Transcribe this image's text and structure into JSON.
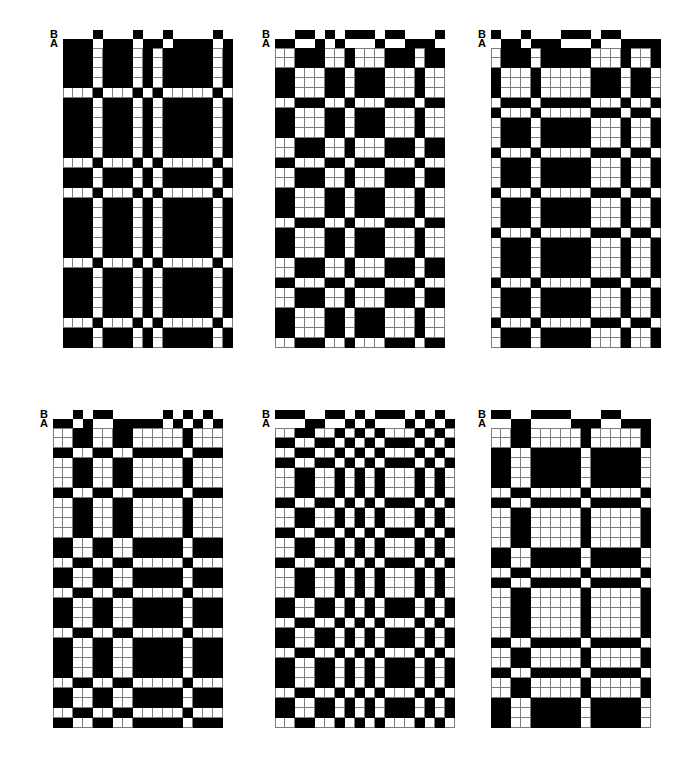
{
  "figure": {
    "kind": "weave-draft-figure",
    "background_color": "#ffffff",
    "ink_color": "#000000",
    "grid_line_color": "#7d7d7d",
    "cell_size_px": 10,
    "shaft_cell_height_px": 9,
    "legend": {
      "shaft_b_label": "B",
      "shaft_a_label": "A"
    }
  },
  "panels": [
    {
      "id": "panel-1",
      "position": "top-left",
      "x": 50,
      "y": 30,
      "columns": 17,
      "rows": 30,
      "shafts": {
        "b_label": "B",
        "a_label": "A",
        "b": [
          0,
          0,
          0,
          1,
          0,
          0,
          0,
          1,
          0,
          0,
          1,
          0,
          0,
          0,
          0,
          1,
          0
        ],
        "a": [
          1,
          1,
          1,
          0,
          1,
          1,
          1,
          0,
          1,
          1,
          0,
          1,
          1,
          1,
          1,
          0,
          1
        ]
      },
      "grid": [
        "11101110111011110111",
        "11101110111011110111",
        "00100011100110000100",
        "11101110111011110111",
        "11101110111011110111",
        "11101110111011110111",
        "11101110111011110111",
        "00100011100110000100",
        "11101110111011110111",
        "00100011100110000100",
        "11101110111011110111",
        "11101110111011110111",
        "11101110111011110111",
        "00100011100110000100",
        "11101110111011110111",
        "11101110111011110111",
        "11101110111011110111",
        "11101110111011110111",
        "00100011100110000100",
        "11101110111011110111",
        "11101110111011110111",
        "00100011100110000100",
        "11101110111011110111"
      ]
    },
    {
      "id": "panel-2",
      "position": "top-center",
      "x": 262,
      "y": 30,
      "columns": 17,
      "rows": 30,
      "shafts": {
        "b_label": "B",
        "a_label": "A",
        "b": [
          0,
          0,
          1,
          1,
          0,
          1,
          0,
          1,
          1,
          1,
          0,
          1,
          1,
          0,
          0,
          0,
          1
        ],
        "a": [
          1,
          1,
          0,
          0,
          1,
          0,
          1,
          0,
          0,
          0,
          1,
          0,
          0,
          1,
          1,
          1,
          0
        ]
      },
      "grid": [
        "1100110011000110011",
        "0011001100111001100",
        "0011001100111001100",
        "1100110011000110011",
        "0011001100111001100",
        "0011001100111001100",
        "1100110011000110011",
        "1100110011000110011",
        "0011001100111001100",
        "1100110011000110011",
        "1100110011000110011",
        "0011001100111001100",
        "0011001100111001100",
        "1100110011000110011",
        "0011001100111001100",
        "0011001100111001100",
        "1100110011000110011",
        "1100110011000110011"
      ]
    },
    {
      "id": "panel-3",
      "position": "top-right",
      "x": 478,
      "y": 30,
      "columns": 17,
      "rows": 30,
      "shafts": {
        "b_label": "B",
        "a_label": "A",
        "b": [
          1,
          0,
          0,
          1,
          0,
          0,
          0,
          1,
          1,
          1,
          0,
          1,
          1,
          0,
          0,
          0,
          0
        ],
        "a": [
          0,
          1,
          1,
          0,
          1,
          1,
          1,
          0,
          0,
          0,
          1,
          0,
          0,
          1,
          1,
          1,
          1
        ]
      },
      "grid": [
        "0110011000110011001",
        "1001100111001100110",
        "0110011000110011001",
        "1001100111001100110",
        "0110011000110011001",
        "1001100111001100110"
      ]
    },
    {
      "id": "panel-4",
      "position": "bottom-left",
      "x": 40,
      "y": 410,
      "columns": 17,
      "rows": 30,
      "shafts": {
        "b_label": "B",
        "a_label": "A",
        "b": [
          0,
          0,
          1,
          0,
          1,
          1,
          0,
          0,
          0,
          0,
          0,
          1,
          0,
          1,
          0,
          1,
          0
        ],
        "a": [
          1,
          1,
          0,
          1,
          0,
          0,
          1,
          1,
          1,
          1,
          1,
          0,
          1,
          0,
          1,
          0,
          1
        ]
      },
      "grid": [
        "1100110011000110011",
        "0011001100111001100"
      ]
    },
    {
      "id": "panel-5",
      "position": "bottom-center",
      "x": 262,
      "y": 410,
      "columns": 18,
      "rows": 30,
      "shafts": {
        "b_label": "B",
        "a_label": "A",
        "b": [
          1,
          1,
          1,
          0,
          0,
          1,
          1,
          0,
          1,
          0,
          1,
          1,
          1,
          0,
          1,
          0,
          1,
          0
        ],
        "a": [
          0,
          0,
          0,
          1,
          1,
          0,
          0,
          1,
          0,
          1,
          0,
          0,
          0,
          1,
          0,
          1,
          0,
          1
        ]
      },
      "grid": [
        "011001100110011001",
        "100110011001100110"
      ]
    },
    {
      "id": "panel-6",
      "position": "bottom-right",
      "x": 478,
      "y": 410,
      "columns": 16,
      "rows": 30,
      "shafts": {
        "b_label": "B",
        "a_label": "A",
        "b": [
          1,
          1,
          0,
          0,
          1,
          1,
          1,
          1,
          0,
          0,
          0,
          1,
          1,
          0,
          0,
          0
        ],
        "a": [
          0,
          0,
          1,
          1,
          0,
          0,
          0,
          0,
          1,
          1,
          1,
          0,
          0,
          1,
          1,
          1
        ]
      },
      "grid": [
        "1100110011001100",
        "0011001100110011"
      ]
    }
  ]
}
